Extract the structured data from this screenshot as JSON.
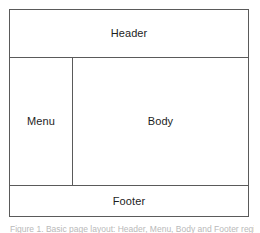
{
  "figure": {
    "caption": "Figure 1. Basic page layout: Header, Menu, Body and Footer regions",
    "frame_color": "#5a5a5a",
    "background_color": "#ffffff",
    "label_color": "#1d1d1d"
  },
  "diagram": {
    "type": "layout-wireframe",
    "regions": [
      {
        "id": "header",
        "label": "Header"
      },
      {
        "id": "menu",
        "label": "Menu"
      },
      {
        "id": "body",
        "label": "Body"
      },
      {
        "id": "footer",
        "label": "Footer"
      }
    ]
  }
}
